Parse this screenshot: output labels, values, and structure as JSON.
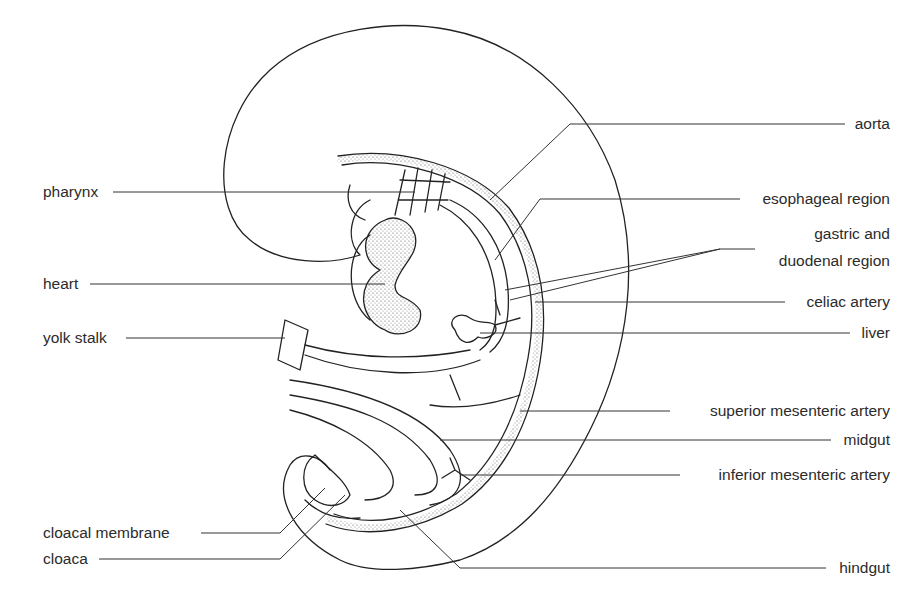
{
  "diagram": {
    "labels_left": [
      {
        "id": "pharynx",
        "text": "pharynx"
      },
      {
        "id": "heart",
        "text": "heart"
      },
      {
        "id": "yolk-stalk",
        "text": "yolk stalk"
      },
      {
        "id": "cloacal-membrane",
        "text": "cloacal membrane"
      },
      {
        "id": "cloaca",
        "text": "cloaca"
      }
    ],
    "labels_right": [
      {
        "id": "aorta",
        "text": "aorta"
      },
      {
        "id": "esophageal-region",
        "text": "esophageal region"
      },
      {
        "id": "gastric-duodenal-line1",
        "text": "gastric and"
      },
      {
        "id": "gastric-duodenal-line2",
        "text": "duodenal region"
      },
      {
        "id": "celiac-artery",
        "text": "celiac artery"
      },
      {
        "id": "liver",
        "text": "liver"
      },
      {
        "id": "superior-mesenteric-artery",
        "text": "superior mesenteric artery"
      },
      {
        "id": "midgut",
        "text": "midgut"
      },
      {
        "id": "inferior-mesenteric-artery",
        "text": "inferior mesenteric artery"
      },
      {
        "id": "hindgut",
        "text": "hindgut"
      }
    ]
  }
}
